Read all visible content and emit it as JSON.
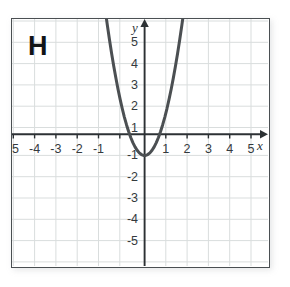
{
  "figure": {
    "panel_letter": "H",
    "background_color": "#ffffff",
    "frame_color": "#4a4f52",
    "grid_color": "#d9dddd",
    "axis_color": "#2c3134",
    "curve_color": "#4b4f52"
  },
  "axes": {
    "x_name": "x",
    "y_name": "y",
    "x_ticks": [
      "-5",
      "-4",
      "-3",
      "-2",
      "-1",
      "1",
      "2",
      "3",
      "4",
      "5"
    ],
    "y_ticks": [
      "5",
      "4",
      "3",
      "2",
      "1",
      "-1",
      "-2",
      "-3",
      "-4",
      "-5"
    ]
  },
  "chart_data": {
    "type": "line",
    "title": "",
    "xlabel": "x",
    "ylabel": "y",
    "xlim": [
      -5.9,
      5.9
    ],
    "ylim": [
      -5.9,
      5.9
    ],
    "grid": true,
    "legend": null,
    "annotations": [
      "H"
    ],
    "xticks": [
      -5,
      -4,
      -3,
      -2,
      -1,
      1,
      2,
      3,
      4,
      5
    ],
    "yticks": [
      5,
      4,
      3,
      2,
      1,
      -1,
      -2,
      -3,
      -4,
      -5
    ],
    "series": [
      {
        "name": "parabola",
        "equation": "y = 2x^2 - 1",
        "vertex": [
          0,
          -1
        ],
        "x_intercepts": [
          -0.707,
          0.707
        ],
        "y_intercept": -1,
        "x": [
          -1.85,
          -1.75,
          -1.65,
          -1.55,
          -1.45,
          -1.35,
          -1.25,
          -1.15,
          -1.05,
          -0.95,
          -0.85,
          -0.75,
          -0.65,
          -0.55,
          -0.45,
          -0.35,
          -0.25,
          -0.15,
          -0.05,
          0.05,
          0.15,
          0.25,
          0.35,
          0.45,
          0.55,
          0.65,
          0.75,
          0.85,
          0.95,
          1.05,
          1.15,
          1.25,
          1.35,
          1.45,
          1.55,
          1.65,
          1.75,
          1.85
        ],
        "y": [
          5.845,
          5.125,
          4.445,
          3.805,
          3.205,
          2.645,
          2.125,
          1.645,
          1.205,
          0.805,
          0.445,
          0.125,
          -0.155,
          -0.395,
          -0.595,
          -0.755,
          -0.875,
          -0.955,
          -0.995,
          -0.995,
          -0.955,
          -0.875,
          -0.755,
          -0.595,
          -0.395,
          -0.155,
          0.125,
          0.445,
          0.805,
          1.205,
          1.645,
          2.125,
          2.645,
          3.205,
          3.805,
          4.445,
          5.125,
          5.845
        ]
      }
    ]
  }
}
